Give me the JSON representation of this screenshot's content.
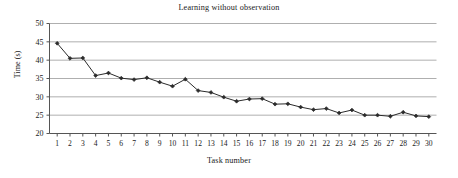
{
  "chart_data": {
    "type": "line",
    "title": "Learning without observation",
    "xlabel": "Task number",
    "ylabel": "Time (s)",
    "xlim": [
      0.4,
      30.6
    ],
    "ylim": [
      20,
      50
    ],
    "yticks": [
      20,
      25,
      30,
      35,
      40,
      45,
      50
    ],
    "grid": "horizontal",
    "legend": "none",
    "marker": "filled-diamond",
    "line_color": "#2b2b2b",
    "grid_color": "#9a9a9a",
    "axis_color": "#555555",
    "x": [
      1,
      2,
      3,
      4,
      5,
      6,
      7,
      8,
      9,
      10,
      11,
      12,
      13,
      14,
      15,
      16,
      17,
      18,
      19,
      20,
      21,
      22,
      23,
      24,
      25,
      26,
      27,
      28,
      29,
      30
    ],
    "xticklabels": [
      "1",
      "2",
      "3",
      "4",
      "5",
      "6",
      "7",
      "8",
      "9",
      "10",
      "11",
      "12",
      "13",
      "14",
      "15",
      "16",
      "17",
      "18",
      "19",
      "20",
      "21",
      "22",
      "23",
      "24",
      "25",
      "26",
      "27",
      "28",
      "29",
      "30"
    ],
    "series": [
      {
        "name": "Time (s)",
        "values": [
          44.6,
          40.5,
          40.6,
          35.8,
          36.5,
          35.1,
          34.7,
          35.2,
          34.0,
          32.9,
          34.8,
          31.7,
          31.2,
          29.9,
          28.8,
          29.4,
          29.5,
          28.0,
          28.1,
          27.2,
          26.5,
          26.8,
          25.6,
          26.4,
          25.0,
          25.0,
          24.7,
          25.8,
          24.8,
          24.6
        ]
      }
    ]
  }
}
